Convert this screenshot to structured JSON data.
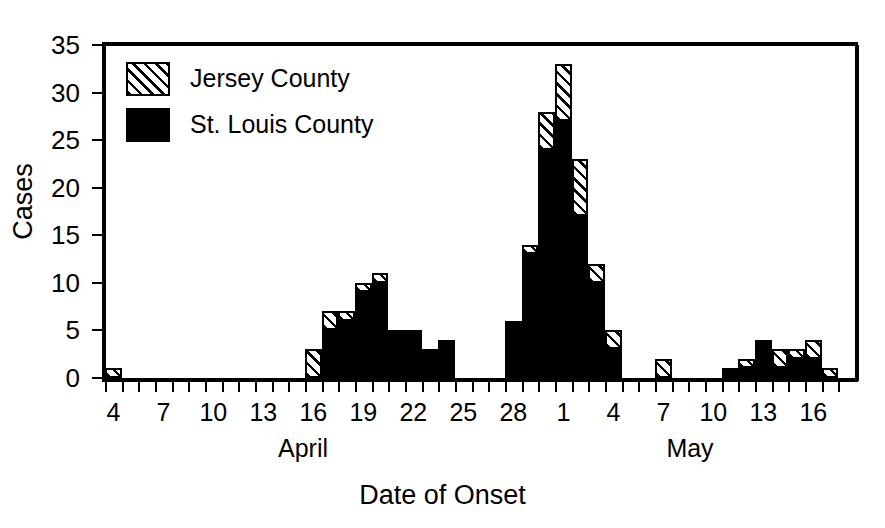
{
  "chart_data": {
    "type": "bar",
    "stacked": true,
    "title": "",
    "xlabel": "Date of Onset",
    "ylabel": "Cases",
    "ylim": [
      0,
      35
    ],
    "ytick_values": [
      0,
      5,
      10,
      15,
      20,
      25,
      30,
      35
    ],
    "grid": false,
    "legend_position": "top-left",
    "month_labels": [
      "April",
      "May"
    ],
    "xtick_labels": [
      "4",
      "7",
      "10",
      "13",
      "16",
      "19",
      "22",
      "25",
      "28",
      "1",
      "4",
      "7",
      "10",
      "13",
      "16"
    ],
    "categories": [
      "Apr 4",
      "Apr 5",
      "Apr 6",
      "Apr 7",
      "Apr 8",
      "Apr 9",
      "Apr 10",
      "Apr 11",
      "Apr 12",
      "Apr 13",
      "Apr 14",
      "Apr 15",
      "Apr 16",
      "Apr 17",
      "Apr 18",
      "Apr 19",
      "Apr 20",
      "Apr 21",
      "Apr 22",
      "Apr 23",
      "Apr 24",
      "Apr 25",
      "Apr 26",
      "Apr 27",
      "Apr 28",
      "Apr 29",
      "Apr 30",
      "May 1",
      "May 2",
      "May 3",
      "May 4",
      "May 5",
      "May 6",
      "May 7",
      "May 8",
      "May 9",
      "May 10",
      "May 11",
      "May 12",
      "May 13",
      "May 14",
      "May 15",
      "May 16",
      "May 17"
    ],
    "series": [
      {
        "name": "St. Louis County",
        "fill": "solid-black",
        "color": "#000000",
        "values": [
          0,
          0,
          0,
          0,
          0,
          0,
          0,
          0,
          0,
          0,
          0,
          0,
          0,
          5,
          6,
          9,
          10,
          5,
          5,
          3,
          4,
          0,
          0,
          0,
          6,
          13,
          24,
          27,
          17,
          10,
          3,
          0,
          0,
          0,
          0,
          0,
          0,
          1,
          1,
          4,
          1,
          2,
          2,
          0
        ]
      },
      {
        "name": "Jersey County",
        "fill": "hatched",
        "color": "#000000",
        "values": [
          1,
          0,
          0,
          0,
          0,
          0,
          0,
          0,
          0,
          0,
          0,
          0,
          3,
          2,
          1,
          1,
          1,
          0,
          0,
          0,
          0,
          0,
          0,
          0,
          0,
          1,
          4,
          6,
          6,
          2,
          2,
          0,
          0,
          2,
          0,
          0,
          0,
          0,
          1,
          0,
          2,
          1,
          2,
          1
        ]
      }
    ],
    "totals": [
      1,
      0,
      0,
      0,
      0,
      0,
      0,
      0,
      0,
      0,
      0,
      0,
      3,
      7,
      7,
      10,
      11,
      5,
      5,
      3,
      4,
      0,
      0,
      0,
      6,
      14,
      28,
      33,
      23,
      12,
      5,
      0,
      0,
      2,
      0,
      0,
      0,
      1,
      2,
      4,
      3,
      3,
      4,
      1
    ]
  },
  "legend": {
    "items": [
      {
        "label": "Jersey County",
        "fill": "hatched"
      },
      {
        "label": "St. Louis County",
        "fill": "solid"
      }
    ]
  },
  "axes": {
    "y_title": "Cases",
    "x_title": "Date of Onset"
  }
}
